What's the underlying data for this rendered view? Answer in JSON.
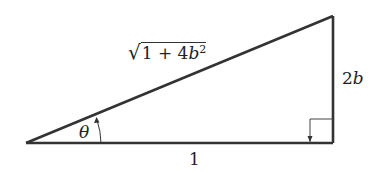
{
  "diagram": {
    "type": "right-triangle",
    "labels": {
      "hypotenuse_radical": "√",
      "hypotenuse_inner": "1 + 4",
      "hypotenuse_var": "b",
      "hypotenuse_exp": "2",
      "opposite_coef": "2",
      "opposite_var": "b",
      "adjacent": "1",
      "angle": "θ"
    },
    "colors": {
      "line": "#333333",
      "background": "#ffffff"
    }
  }
}
